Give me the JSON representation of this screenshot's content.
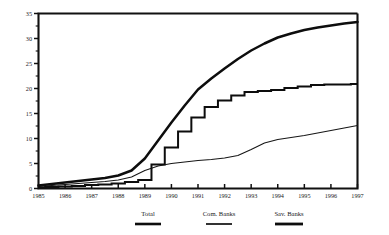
{
  "chart_data": {
    "type": "line",
    "title": "",
    "subtitle": "",
    "xlabel": "",
    "ylabel": "",
    "xlim": [
      1985,
      1997
    ],
    "ylim": [
      0,
      35
    ],
    "grid": false,
    "legend_position": "bottom",
    "x_tick_labels": [
      "1985",
      "1986",
      "1987",
      "1988",
      "1989",
      "1990",
      "1991",
      "1992",
      "1993",
      "1994",
      "1995",
      "1996",
      "1997"
    ],
    "y_tick_labels": [
      "0",
      "5",
      "10",
      "15",
      "20",
      "25",
      "30",
      "35"
    ],
    "y_ticks": [
      0,
      5,
      10,
      15,
      20,
      25,
      30,
      35
    ],
    "y_minor_step": 2.5,
    "x": [
      1985,
      1985.5,
      1986,
      1986.5,
      1987,
      1987.5,
      1988,
      1988.5,
      1989,
      1989.5,
      1990,
      1990.5,
      1991,
      1991.5,
      1992,
      1992.5,
      1993,
      1993.5,
      1994,
      1994.5,
      1995,
      1995.5,
      1996,
      1996.5,
      1997
    ],
    "series": [
      {
        "name": "Total",
        "label": "Total",
        "color": "#0d0d0d",
        "values": [
          0.6,
          0.9,
          1.2,
          1.5,
          1.8,
          2.1,
          2.6,
          3.6,
          6.0,
          9.6,
          13.2,
          16.6,
          19.8,
          22.0,
          24.0,
          25.9,
          27.6,
          29.0,
          30.2,
          31.0,
          31.7,
          32.2,
          32.6,
          33.0,
          33.3
        ]
      },
      {
        "name": "Com. Banks",
        "label": "Com. Banks",
        "color": "#0d0d0d",
        "values": [
          0.2,
          0.3,
          0.4,
          0.5,
          0.7,
          0.8,
          1.0,
          1.3,
          1.7,
          4.8,
          8.2,
          11.4,
          14.2,
          16.3,
          17.6,
          18.6,
          19.3,
          19.5,
          19.7,
          20.1,
          20.4,
          20.7,
          20.8,
          20.8,
          20.9
        ]
      },
      {
        "name": "Sav. Banks",
        "label": "Sav. Banks",
        "color": "#161616",
        "values": [
          0.4,
          0.6,
          0.8,
          1.0,
          1.2,
          1.4,
          1.7,
          2.3,
          3.6,
          4.5,
          5.0,
          5.3,
          5.6,
          5.8,
          6.1,
          6.6,
          7.8,
          9.1,
          9.8,
          10.2,
          10.6,
          11.1,
          11.6,
          12.1,
          12.6
        ]
      }
    ]
  },
  "legend": {
    "items": [
      {
        "label": "Total"
      },
      {
        "label": "Com. Banks"
      },
      {
        "label": "Sav. Banks"
      }
    ]
  }
}
